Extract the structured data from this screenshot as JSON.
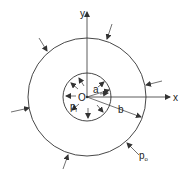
{
  "diagram": {
    "labels": {
      "y_axis": "y",
      "x_axis": "x",
      "origin": "O",
      "inner_radius": "a",
      "outer_radius": "b",
      "inner_pressure": "p",
      "inner_pressure_sub": "i",
      "outer_pressure": "p",
      "outer_pressure_sub": "o"
    },
    "colors": {
      "stroke": "#333333",
      "background": "#ffffff"
    }
  }
}
